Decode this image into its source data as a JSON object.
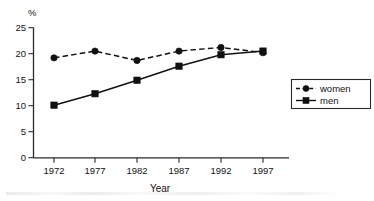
{
  "chart_data": {
    "type": "line",
    "title": "",
    "xlabel": "Year",
    "ylabel": "%",
    "categories": [
      "1972",
      "1977",
      "1982",
      "1987",
      "1992",
      "1997"
    ],
    "x": [
      1972,
      1977,
      1982,
      1987,
      1992,
      1997
    ],
    "series": [
      {
        "name": "women",
        "marker": "circle",
        "linestyle": "dashed",
        "color": "#111111",
        "values": [
          19.2,
          20.5,
          18.7,
          20.5,
          21.2,
          20.2
        ]
      },
      {
        "name": "men",
        "marker": "square",
        "linestyle": "solid",
        "color": "#111111",
        "values": [
          10.1,
          12.3,
          14.9,
          17.6,
          19.8,
          20.5
        ]
      }
    ],
    "ylim": [
      0,
      25
    ],
    "yticks": [
      0,
      5,
      10,
      15,
      20,
      25
    ],
    "ytick_labels": [
      "0",
      "5",
      "10",
      "15",
      "20",
      "25"
    ],
    "xtick_labels": [
      "1972",
      "1977",
      "1982",
      "1987",
      "1992",
      "1997"
    ],
    "grid": false,
    "legend_position": "right",
    "legend_entries": [
      "women",
      "men"
    ]
  },
  "axes": {
    "y_unit_label": "%",
    "x_axis_title": "Year",
    "y_ticks": [
      {
        "label": "25",
        "value": 25
      },
      {
        "label": "20",
        "value": 20
      },
      {
        "label": "15",
        "value": 15
      },
      {
        "label": "10",
        "value": 10
      },
      {
        "label": "5",
        "value": 5
      },
      {
        "label": "0",
        "value": 0
      }
    ],
    "x_ticks": [
      {
        "label": "1972"
      },
      {
        "label": "1977"
      },
      {
        "label": "1982"
      },
      {
        "label": "1987"
      },
      {
        "label": "1992"
      },
      {
        "label": "1997"
      }
    ]
  },
  "legend": {
    "items": [
      {
        "label": "women",
        "marker": "circle",
        "style": "dashed"
      },
      {
        "label": "men",
        "marker": "square",
        "style": "solid"
      }
    ]
  }
}
